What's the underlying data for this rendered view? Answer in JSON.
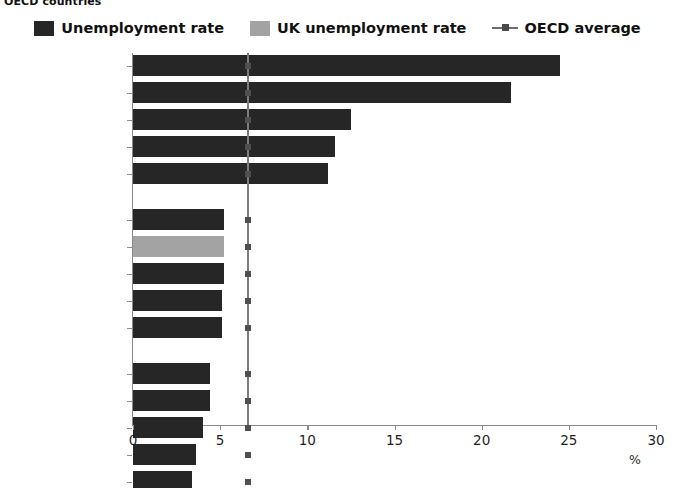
{
  "title": "OECD countries",
  "legend": {
    "position": "top-center",
    "items": [
      {
        "label": "Unemployment rate",
        "marker": "square-swatch",
        "color": "#262626"
      },
      {
        "label": "UK unemployment rate",
        "marker": "square-swatch",
        "color": "#a3a3a3"
      },
      {
        "label": "OECD average",
        "marker": "line-with-dot",
        "color": "#6d6d6d"
      }
    ]
  },
  "axis": {
    "x_unit_label": "%",
    "x_ticks": [
      "0",
      "5",
      "10",
      "15",
      "20",
      "25",
      "30"
    ]
  },
  "chart_data": {
    "type": "bar",
    "orientation": "horizontal",
    "title": "OECD countries",
    "xlabel": "%",
    "ylabel": "",
    "xlim": [
      0,
      30
    ],
    "grid": false,
    "legend_position": "top-center",
    "categories": [
      "Greece",
      "Spain",
      "Portugal",
      "Italy",
      "Slovakia",
      "New Zealand",
      "UK",
      "United States",
      "Israel",
      "Czech Republic",
      "Norway",
      "Mexico",
      "Iceland",
      "Korea",
      "Japan"
    ],
    "values": [
      24.5,
      21.7,
      12.5,
      11.6,
      11.2,
      5.2,
      5.2,
      5.2,
      5.1,
      5.1,
      4.4,
      4.4,
      4.0,
      3.6,
      3.4
    ],
    "highlighted_category": "UK",
    "group_breaks": [
      5,
      10
    ],
    "series": [
      {
        "name": "Unemployment rate",
        "values": [
          24.5,
          21.7,
          12.5,
          11.6,
          11.2,
          5.2,
          5.2,
          5.2,
          5.1,
          5.1,
          4.4,
          4.4,
          4.0,
          3.6,
          3.4
        ]
      },
      {
        "name": "OECD average",
        "type": "vline",
        "value": 6.6
      }
    ],
    "annotations": []
  }
}
